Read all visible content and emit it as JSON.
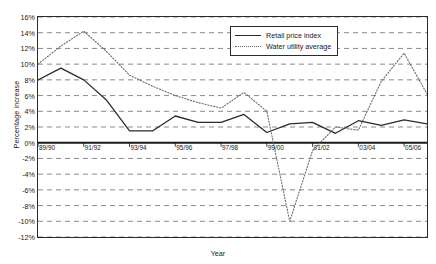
{
  "chart_data": {
    "type": "line",
    "title": "",
    "xlabel": "Year",
    "ylabel": "Percentage increase",
    "grid": true,
    "legend_position": "top-right",
    "ylim": [
      -12,
      16
    ],
    "ytick_step": 2,
    "ytick_labels": [
      "16%",
      "14%",
      "12%",
      "10%",
      "8%",
      "6%",
      "4%",
      "2%",
      "0%",
      "-2%",
      "-4%",
      "-6%",
      "-8%",
      "-10%",
      "-12%"
    ],
    "ytick_values": [
      16,
      14,
      12,
      10,
      8,
      6,
      4,
      2,
      0,
      -2,
      -4,
      -6,
      -8,
      -10,
      -12
    ],
    "categories": [
      "89/90",
      "90/91",
      "91/92",
      "92/93",
      "93/94",
      "94/95",
      "95/96",
      "96/97",
      "97/98",
      "98/99",
      "99/00",
      "00/01",
      "01/02",
      "02/03",
      "03/04",
      "04/05",
      "05/06",
      "06/07"
    ],
    "xtick_labels": [
      "89/90",
      "91/92",
      "93/94",
      "95/96",
      "97/98",
      "99/00",
      "01/02",
      "03/04",
      "05/06"
    ],
    "series": [
      {
        "name": "Retail price index",
        "style": "solid",
        "color": "#2b2b2b",
        "values": [
          8.0,
          9.5,
          8.0,
          5.4,
          1.5,
          1.5,
          3.4,
          2.6,
          2.6,
          3.6,
          1.3,
          2.4,
          2.6,
          1.2,
          2.8,
          2.2,
          2.9,
          2.4
        ]
      },
      {
        "name": "Water utility average",
        "style": "dotted",
        "color": "#6b6b6b",
        "values": [
          10.0,
          12.3,
          14.2,
          11.6,
          8.6,
          7.2,
          6.0,
          5.1,
          4.4,
          6.4,
          4.0,
          -10.0,
          -1.0,
          2.0,
          1.6,
          7.8,
          11.4,
          6.2
        ]
      }
    ]
  },
  "legend": {
    "items": [
      {
        "label": "Retail price index",
        "style": "solid"
      },
      {
        "label": "Water utility average",
        "style": "dotted"
      }
    ]
  },
  "axes": {
    "y_title": "Percentage increase",
    "x_title": "Year"
  }
}
